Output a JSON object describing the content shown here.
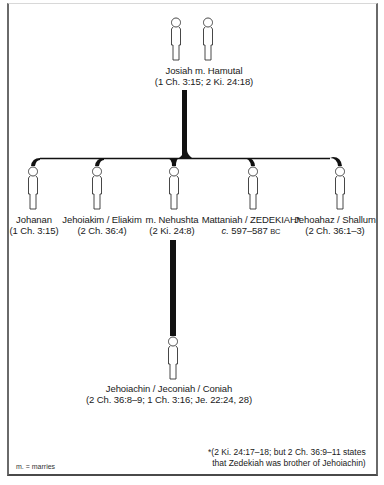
{
  "diagram": {
    "type": "family-tree",
    "line_color": "#111111",
    "frame_color": "#5a5a5a"
  },
  "parents": {
    "names": "Josiah m. Hamutal",
    "refs": "(1 Ch. 3:15; 2 Ki. 24:18)"
  },
  "children": [
    {
      "name": "Johanan",
      "refs": "(1 Ch. 3:15)"
    },
    {
      "name": "Jehoiakim / Eliakim",
      "refs": "(2 Ch. 36:4)"
    },
    {
      "name": "m. Nehushta",
      "refs": "(2 Ki. 24:8)"
    },
    {
      "name": "Mattaniah / ZEDEKIAH*",
      "refs_prefix": "c.",
      "refs": " 597–587 ",
      "refs_suffix": "BC"
    },
    {
      "name": "Jehoahaz / Shallum",
      "refs": "(2 Ch. 36:1–3)"
    }
  ],
  "grandchild": {
    "name": "Jehoiachin / Jeconiah / Coniah",
    "refs": "(2 Ch. 36:8–9; 1 Ch. 3:16; Je. 22:24, 28)"
  },
  "footnote": {
    "line1": "*(2 Ki. 24:17–18; but 2 Ch. 36:9–11 states",
    "line2": "that Zedekiah was brother of Jehoiachin)"
  },
  "legend": {
    "text": "m. = marries"
  }
}
